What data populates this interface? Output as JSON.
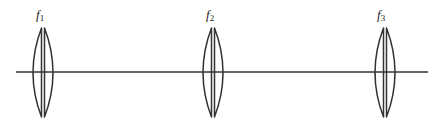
{
  "diagram": {
    "type": "optical-system",
    "stroke_color": "#333333",
    "background": "#ffffff",
    "axis": {
      "x1": 16,
      "x2": 428,
      "y": 72
    },
    "lenses": [
      {
        "id": "lens-1",
        "cx": 43,
        "label_base": "f",
        "label_sub": "1",
        "label_x": 36,
        "label_y": 8
      },
      {
        "id": "lens-2",
        "cx": 213,
        "label_base": "f",
        "label_sub": "2",
        "label_x": 206,
        "label_y": 8
      },
      {
        "id": "lens-3",
        "cx": 385,
        "label_base": "f",
        "label_sub": "3",
        "label_x": 377,
        "label_y": 8
      }
    ],
    "lens_geometry": {
      "top": 28,
      "bottom": 117,
      "half_width": 10,
      "gap": 1.5
    }
  }
}
